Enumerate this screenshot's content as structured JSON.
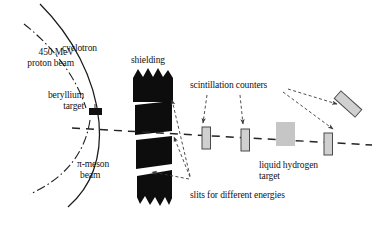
{
  "figure": {
    "background": "#ffffff",
    "width": 380,
    "height": 231
  },
  "labels": {
    "cyclotron": "cyclotron",
    "proton_beam_line1": "450 MeV",
    "proton_beam_line2": "proton beam",
    "beryllium_line1": "beryllium",
    "beryllium_line2": "target",
    "shielding": "shielding",
    "pi_meson_line1": "π-meson",
    "pi_meson_line2": "beam",
    "slits": "slits for different energies",
    "scintillation_counters": "scintillation counters",
    "liquid_hydrogen_line1": "liquid hydrogen",
    "liquid_hydrogen_line2": "target"
  },
  "colors": {
    "ink": "#111111",
    "shielding_fill": "#0d0d0d",
    "counter_fill": "#d0d0d0",
    "counter_stroke": "#4a4a4a",
    "target_fill": "#c6c6c6",
    "beryllium_fill": "#101010",
    "beam_dash": "#2a2a2a"
  },
  "beam_line": {
    "name": "pi-meson-beam-path",
    "style": "dashed",
    "start_x": 72,
    "start_y": 128,
    "end_x": 372,
    "end_y": 145
  },
  "counters": [
    {
      "name": "counter-1",
      "x": 206,
      "y": 138,
      "width": 9,
      "height": 22,
      "rotation": 0
    },
    {
      "name": "counter-2",
      "x": 245,
      "y": 140,
      "width": 9,
      "height": 22,
      "rotation": 0
    },
    {
      "name": "counter-3",
      "x": 328,
      "y": 145,
      "width": 9,
      "height": 22,
      "rotation": 0
    },
    {
      "name": "counter-tilted",
      "x": 348,
      "y": 104,
      "width": 10,
      "height": 28,
      "rotation": -48
    }
  ],
  "targets": {
    "beryllium": {
      "x": 89,
      "y": 108,
      "width": 13,
      "height": 7
    },
    "liquid_hydrogen": {
      "x": 285,
      "y": 134,
      "width": 19,
      "height": 24
    }
  },
  "shielding_blocks": [
    {
      "name": "shielding-block-1",
      "top": 71,
      "height": 29
    },
    {
      "name": "shielding-block-2",
      "top": 104,
      "height": 30
    },
    {
      "name": "shielding-block-3",
      "top": 139,
      "height": 27
    },
    {
      "name": "shielding-block-4",
      "top": 172,
      "height": 32
    }
  ]
}
